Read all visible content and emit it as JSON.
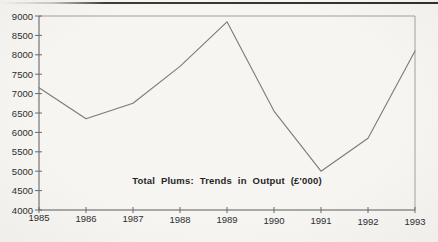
{
  "page": {
    "background": "#f6f5f1",
    "top_rule_color": "#3c3c3c"
  },
  "chart_data": {
    "type": "line",
    "title": "Total Plums: Trends in Output (£'000)",
    "categories": [
      "1985",
      "1986",
      "1987",
      "1988",
      "1989",
      "1990",
      "1991",
      "1992",
      "1993"
    ],
    "values": [
      7150,
      6350,
      6750,
      7700,
      8850,
      6550,
      5000,
      5850,
      8100
    ],
    "xlabel": "",
    "ylabel": "",
    "ylim": [
      4000,
      9000
    ],
    "ytick_step": 500,
    "yticks": [
      "4000",
      "4500",
      "5000",
      "5500",
      "6000",
      "6500",
      "7000",
      "7500",
      "8000",
      "8500",
      "9000"
    ],
    "grid": false,
    "legend": "none",
    "colors": {
      "line": "#7a7a7a",
      "axis": "#5a5a5a",
      "box": "#a0a09c",
      "tick": "#6a6a6a",
      "tick_label": "#2e2e2e",
      "title": "#262626"
    }
  }
}
